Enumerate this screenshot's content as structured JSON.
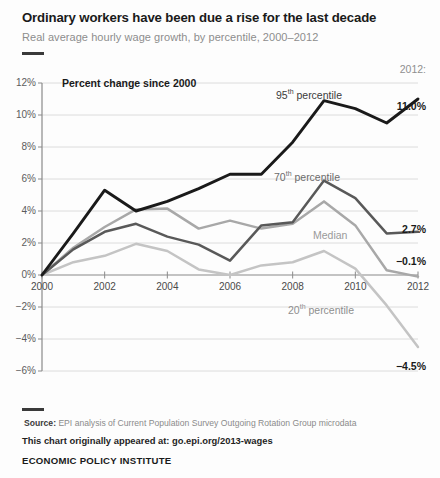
{
  "header": {
    "title": "Ordinary workers have been due a rise for the last decade",
    "subtitle": "Real average hourly wage growth, by percentile, 2000–2012"
  },
  "axis_note": "Percent change since 2000",
  "year_head": "2012:",
  "footer": {
    "source_label": "Source:",
    "source_text": " EPI analysis of Current Population Survey Outgoing Rotation Group microdata",
    "chart_note": "This chart originally appeared at: go.epi.org/2013-wages",
    "organization": "ECONOMIC POLICY INSTITUTE"
  },
  "labels": {
    "p95": "95",
    "p95_sup": "th",
    "p95_rest": " percentile",
    "p70": "70",
    "p70_sup": "th",
    "p70_rest": " percentile",
    "median": "Median",
    "p20": "20",
    "p20_sup": "th",
    "p20_rest": " percentile"
  },
  "end_values": {
    "p95": "11.0%",
    "p70": "2.7%",
    "median": "−0.1%",
    "p20": "−4.5%"
  },
  "colors": {
    "p95": "#1a1a1a",
    "p70": "#595959",
    "median": "#a8a8a8",
    "p20": "#c4c4c4",
    "grid": "#d8d8d8",
    "axis": "#8a8a8a",
    "subtitle": "#8d8d8d"
  },
  "chart_data": {
    "type": "line",
    "title": "Ordinary workers have been due a rise for the last decade",
    "subtitle": "Real average hourly wage growth, by percentile, 2000–2012",
    "xlabel": "",
    "ylabel": "Percent change since 2000",
    "x": [
      2000,
      2001,
      2002,
      2003,
      2004,
      2005,
      2006,
      2007,
      2008,
      2009,
      2010,
      2011,
      2012
    ],
    "xlim": [
      2000,
      2012
    ],
    "ylim": [
      -6,
      12
    ],
    "xticks": [
      2000,
      2002,
      2004,
      2006,
      2008,
      2010,
      2012
    ],
    "xtick_labels": [
      "2000",
      "2002",
      "2004",
      "2006",
      "2008",
      "2010",
      "2012"
    ],
    "yticks": [
      -6,
      -4,
      -2,
      0,
      2,
      4,
      6,
      8,
      10,
      12
    ],
    "ytick_labels": [
      "−6%",
      "−4%",
      "−2%",
      "0%",
      "2%",
      "4%",
      "6%",
      "8%",
      "10%",
      "12%"
    ],
    "grid": "horizontal",
    "legend": "inline-annotations",
    "series": [
      {
        "name": "95th percentile",
        "color": "#1a1a1a",
        "values": [
          0.0,
          2.6,
          5.3,
          4.0,
          4.6,
          5.4,
          6.3,
          6.3,
          8.3,
          10.9,
          10.4,
          9.5,
          11.0
        ],
        "end_label": "11.0%"
      },
      {
        "name": "70th percentile",
        "color": "#595959",
        "values": [
          0.0,
          1.6,
          2.7,
          3.2,
          2.4,
          1.9,
          0.9,
          3.1,
          3.3,
          5.9,
          4.8,
          2.6,
          2.7
        ],
        "end_label": "2.7%"
      },
      {
        "name": "Median",
        "color": "#a8a8a8",
        "values": [
          0.0,
          1.7,
          3.0,
          4.1,
          4.15,
          2.9,
          3.4,
          2.9,
          3.2,
          4.6,
          3.1,
          0.3,
          -0.1
        ],
        "end_label": "−0.1%"
      },
      {
        "name": "20th percentile",
        "color": "#c4c4c4",
        "values": [
          0.0,
          0.8,
          1.2,
          1.95,
          1.5,
          0.35,
          0.0,
          0.6,
          0.8,
          1.5,
          0.4,
          -1.9,
          -4.5
        ],
        "end_label": "−4.5%"
      }
    ]
  }
}
